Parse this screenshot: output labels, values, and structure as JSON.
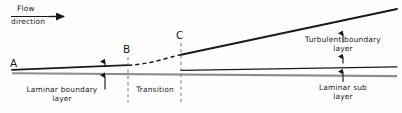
{
  "figure": {
    "type": "technical-diagram",
    "background_color": "#ffffff",
    "line_color": "#1a1a1a",
    "plate_color": "#8a8a8a"
  },
  "annotations": {
    "flow_label_line1": "Flow",
    "flow_label_line2": "direction",
    "point_a": "A",
    "point_b": "B",
    "point_c": "C",
    "laminar_bl_line1": "Laminar  boundary",
    "laminar_bl_line2": "layer",
    "transition": "Transition",
    "turbulent_bl_line1": "Turbulent  boundary",
    "turbulent_bl_line2": "layer",
    "laminar_sub_line1": "Laminar  sub",
    "laminar_sub_line2": "layer"
  },
  "geometry": {
    "plate_start_x": 12,
    "plate_end_x": 397,
    "plate_y_start": 73,
    "plate_y_end": 76,
    "laminar_edge_start": [
      12,
      70
    ],
    "laminar_edge_b": [
      128,
      65
    ],
    "transition_curve_b": [
      128,
      65
    ],
    "transition_curve_c": [
      181,
      55
    ],
    "turbulent_edge_c": [
      181,
      55
    ],
    "turbulent_edge_end": [
      397,
      9
    ],
    "sublayer_start_x": 181,
    "sublayer_end_x": 397,
    "sublayer_y_at_c": 70,
    "sublayer_y_end": 67,
    "station_b_x": 128,
    "station_c_x": 181,
    "dim_arrow_laminar_x": 105,
    "dim_arrow_sub_x": 343
  }
}
